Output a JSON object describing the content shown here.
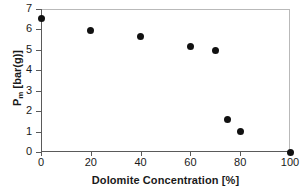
{
  "chart_data": {
    "type": "scatter",
    "title": "",
    "xlabel": "Dolomite Concentration [%]",
    "ylabel": "P_m [bar(g)]",
    "ylabel_base": "P",
    "ylabel_sub": "m",
    "ylabel_unit": " [bar(g)]",
    "xlim": [
      0,
      100
    ],
    "ylim": [
      0,
      7
    ],
    "xticks": [
      0,
      20,
      40,
      60,
      80,
      100
    ],
    "yticks": [
      0,
      1,
      2,
      3,
      4,
      5,
      6,
      7
    ],
    "xtick_labels": [
      "0",
      "20",
      "40",
      "60",
      "80",
      "100"
    ],
    "ytick_labels": [
      "0",
      "1",
      "2",
      "3",
      "4",
      "5",
      "6",
      "7"
    ],
    "grid": false,
    "legend": null,
    "marker": "filled-circle",
    "marker_color": "#111111",
    "series": [
      {
        "name": "Pm vs Dolomite Concentration",
        "x": [
          0,
          20,
          40,
          60,
          70,
          75,
          80,
          100
        ],
        "y": [
          6.55,
          5.95,
          5.65,
          5.15,
          4.95,
          1.58,
          0.98,
          0.0
        ]
      }
    ]
  },
  "colors": {
    "frame": "#b9b9b9",
    "axis": "#5a5a5a",
    "text": "#1a1a1a",
    "marker": "#111111",
    "background": "#ffffff"
  }
}
